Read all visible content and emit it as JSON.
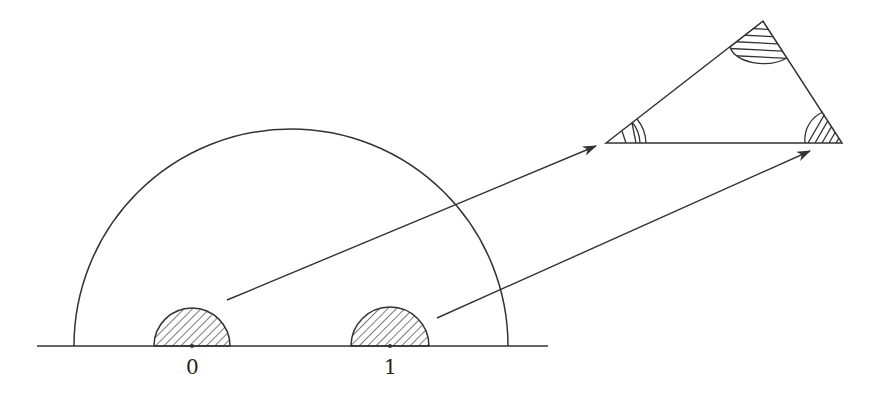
{
  "diagram": {
    "stroke_color": "#333333",
    "background": "#ffffff",
    "baseline": {
      "x1": 37,
      "x2": 548,
      "y": 346
    },
    "large_semicircle": {
      "cx": 291,
      "cy": 346,
      "r": 217
    },
    "small_semicircles": [
      {
        "id": "zero",
        "cx": 192,
        "cy": 346,
        "r": 38,
        "label": "0"
      },
      {
        "id": "one",
        "cx": 390,
        "cy": 346,
        "r": 39,
        "label": "1"
      }
    ],
    "triangle": {
      "left": [
        606,
        143
      ],
      "top": [
        763,
        21
      ],
      "right": [
        842,
        143
      ]
    },
    "arrows": [
      {
        "from": [
          227,
          300
        ],
        "to": [
          596,
          146
        ]
      },
      {
        "from": [
          437,
          318
        ],
        "to": [
          810,
          151
        ]
      }
    ],
    "labels": {
      "zero": "0",
      "one": "1"
    }
  }
}
